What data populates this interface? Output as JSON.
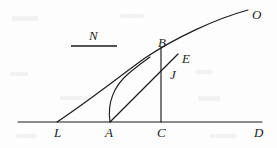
{
  "figure": {
    "kind": "geometry-diagram",
    "background_color": "#fdfdfd",
    "ink_color": "#1b1b1b",
    "stroke_width": 1.15,
    "canvas": {
      "width": 277,
      "height": 148
    },
    "labels": [
      {
        "id": "O",
        "text": "O",
        "x": 252,
        "y": 8,
        "name": "point-label-o"
      },
      {
        "id": "B",
        "text": "B",
        "x": 158,
        "y": 36,
        "name": "point-label-b"
      },
      {
        "id": "E",
        "text": "E",
        "x": 182,
        "y": 52,
        "name": "point-label-e"
      },
      {
        "id": "J",
        "text": "J",
        "x": 170,
        "y": 68,
        "name": "point-label-j"
      },
      {
        "id": "N",
        "text": "N",
        "x": 89,
        "y": 29,
        "name": "segment-label-n"
      },
      {
        "id": "L",
        "text": "L",
        "x": 54,
        "y": 126,
        "name": "point-label-l"
      },
      {
        "id": "A",
        "text": "A",
        "x": 105,
        "y": 126,
        "name": "point-label-a"
      },
      {
        "id": "C",
        "text": "C",
        "x": 157,
        "y": 126,
        "name": "point-label-c"
      },
      {
        "id": "D",
        "text": "D",
        "x": 254,
        "y": 126,
        "name": "point-label-d"
      }
    ],
    "baseline": {
      "name": "baseline-ld",
      "x1": 18,
      "y1": 122,
      "x2": 262,
      "y2": 122
    },
    "n_segment": {
      "name": "segment-n-underline",
      "x1": 71,
      "y1": 46,
      "x2": 117,
      "y2": 46
    },
    "vertical_bc": {
      "name": "segment-bc-vertical",
      "x1": 161,
      "y1": 47,
      "x2": 161,
      "y2": 122
    },
    "main_curve": {
      "name": "curve-l-b-o",
      "path": "M 57 122 C 90 100, 120 76, 145 58 C 175 38, 215 19, 248 10"
    },
    "chord_ae": {
      "name": "segment-a-e",
      "x1": 110,
      "y1": 122,
      "x2": 178,
      "y2": 54
    },
    "inner_curve": {
      "name": "curve-a-to-main",
      "path": "M 110 122 C 107 103, 114 86, 128 74 C 135 68, 143 62, 150 57"
    },
    "points": [
      {
        "id": "L",
        "x": 57,
        "y": 122
      },
      {
        "id": "A",
        "x": 110,
        "y": 122
      },
      {
        "id": "C",
        "x": 161,
        "y": 122
      },
      {
        "id": "D",
        "x": 262,
        "y": 122
      },
      {
        "id": "B",
        "x": 161,
        "y": 47
      },
      {
        "id": "J",
        "x": 161,
        "y": 61
      },
      {
        "id": "E",
        "x": 178,
        "y": 54
      },
      {
        "id": "O",
        "x": 248,
        "y": 10
      }
    ]
  }
}
